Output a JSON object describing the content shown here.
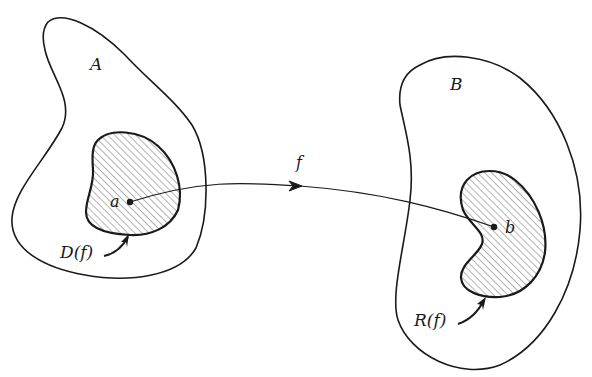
{
  "diagram": {
    "type": "function-mapping",
    "sets": {
      "domain_set": {
        "label": "A"
      },
      "codomain_set": {
        "label": "B"
      }
    },
    "regions": {
      "domain_region": {
        "label": "D(f)"
      },
      "range_region": {
        "label": "R(f)"
      }
    },
    "points": {
      "source_point": {
        "label": "a"
      },
      "image_point": {
        "label": "b"
      }
    },
    "mapping": {
      "label": "f"
    },
    "colors": {
      "stroke": "#1a1a1a",
      "background": "#ffffff",
      "hatch": "#555555"
    }
  }
}
